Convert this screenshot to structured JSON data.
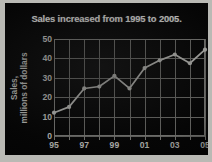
{
  "figure": {
    "background_color": "#b9b9b4",
    "panel_color": "#050505",
    "line_color": "#d9d9d4",
    "grid_color": "#7d7d79",
    "text_color": "#dcdcd8"
  },
  "chart_data": {
    "type": "line",
    "title": "Sales increased from 1995 to 2005.",
    "xlabel": "",
    "ylabel_line1": "Sales,",
    "ylabel_line2": "millions of dollars",
    "ylabel": "Sales, millions of dollars",
    "x": [
      1995,
      1996,
      1997,
      1998,
      1999,
      2000,
      2001,
      2002,
      2003,
      2004,
      2005
    ],
    "categories": [
      "95",
      "96",
      "97",
      "98",
      "99",
      "00",
      "01",
      "02",
      "03",
      "04",
      "05"
    ],
    "values": [
      12,
      15,
      24.5,
      25.5,
      31,
      24.5,
      35,
      39,
      42,
      37.5,
      44.5
    ],
    "xtick_labels": [
      "95",
      "97",
      "99",
      "01",
      "03",
      "05"
    ],
    "xtick_values": [
      1995,
      1997,
      1999,
      2001,
      2003,
      2005
    ],
    "ytick_labels": [
      "0",
      "10",
      "20",
      "30",
      "40",
      "50"
    ],
    "ytick_values": [
      0,
      10,
      20,
      30,
      40,
      50
    ],
    "xlim": [
      1995,
      2005
    ],
    "ylim": [
      0,
      50
    ],
    "grid": true,
    "legend": false,
    "markers": true
  }
}
